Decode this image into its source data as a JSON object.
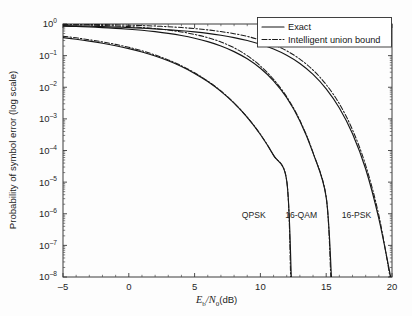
{
  "chart_data": {
    "type": "line",
    "title": "",
    "xlabel": "E_b/N_0(dB)",
    "ylabel": "Probability of symbol error (log scale)",
    "xlim": [
      -5,
      20
    ],
    "ylim": [
      1e-08,
      1
    ],
    "yscale": "log",
    "grid": false,
    "xticks": [
      -5,
      0,
      5,
      10,
      15,
      20
    ],
    "xtick_labels": [
      "-5",
      "0",
      "5",
      "10",
      "15",
      "20"
    ],
    "yticks": [
      1,
      0.1,
      0.01,
      0.001,
      0.0001,
      1e-05,
      1e-06,
      1e-07,
      1e-08
    ],
    "ytick_labels": [
      "10^0",
      "10^-1",
      "10^-2",
      "10^-3",
      "10^-4",
      "10^-5",
      "10^-6",
      "10^-7",
      "10^-8"
    ],
    "ytick_mantissa": [
      "10",
      "10",
      "10",
      "10",
      "10",
      "10",
      "10",
      "10",
      "10"
    ],
    "ytick_exponent": [
      "0",
      "-1",
      "-2",
      "-3",
      "-4",
      "-5",
      "-6",
      "-7",
      "-8"
    ],
    "legend_position": "upper right",
    "legend_entries": [
      {
        "label": "Exact",
        "style": "solid"
      },
      {
        "label": "Intelligent union bound",
        "style": "dashdot"
      }
    ],
    "annotations": [
      {
        "text": "QPSK",
        "x": 9.5,
        "y_decade": -6.15
      },
      {
        "text": "16-QAM",
        "x": 13.1,
        "y_decade": -6.15
      },
      {
        "text": "16-PSK",
        "x": 17.3,
        "y_decade": -6.15
      }
    ],
    "series": [
      {
        "name": "QPSK",
        "style": "solid",
        "variant": "Exact",
        "x": [
          -5,
          -4,
          -3,
          -2,
          -1,
          0,
          1,
          2,
          3,
          4,
          5,
          6,
          7,
          8,
          9,
          10,
          11,
          12,
          12.35
        ],
        "y": [
          0.372,
          0.33,
          0.288,
          0.246,
          0.205,
          0.166,
          0.13,
          0.097,
          0.0684,
          0.0451,
          0.0274,
          0.0151,
          0.00739,
          0.00313,
          0.00111,
          0.00032,
          7e-05,
          1.1e-05,
          1e-08
        ]
      },
      {
        "name": "QPSK",
        "style": "dashdot",
        "variant": "Intelligent union bound",
        "x": [
          -5,
          -4,
          -3,
          -2,
          -1,
          0,
          1,
          2,
          3,
          4,
          5,
          6,
          7,
          8,
          9,
          10,
          11,
          12,
          12.3
        ],
        "y": [
          0.41,
          0.365,
          0.318,
          0.272,
          0.227,
          0.183,
          0.142,
          0.105,
          0.0733,
          0.0478,
          0.0287,
          0.0157,
          0.00762,
          0.0032,
          0.00113,
          0.000325,
          7.1e-05,
          1.12e-05,
          1e-08
        ]
      },
      {
        "name": "16-QAM",
        "style": "solid",
        "variant": "Exact",
        "x": [
          -5,
          -4,
          -3,
          -2,
          -1,
          0,
          1,
          2,
          3,
          4,
          5,
          6,
          7,
          8,
          9,
          10,
          11,
          12,
          13,
          14,
          15,
          15.4
        ],
        "y": [
          0.86,
          0.835,
          0.805,
          0.77,
          0.73,
          0.685,
          0.632,
          0.572,
          0.505,
          0.432,
          0.355,
          0.277,
          0.202,
          0.134,
          0.079,
          0.0397,
          0.0159,
          0.00465,
          0.00086,
          8.4e-05,
          3.3e-06,
          1e-08
        ]
      },
      {
        "name": "16-QAM",
        "style": "dashdot",
        "variant": "Intelligent union bound",
        "x": [
          -5,
          -4,
          -3,
          -2,
          -1,
          0,
          1,
          2,
          3,
          4,
          5,
          6,
          7,
          8,
          9,
          10,
          11,
          12,
          13,
          14,
          15,
          15.35
        ],
        "y": [
          0.96,
          0.945,
          0.925,
          0.9,
          0.868,
          0.828,
          0.778,
          0.716,
          0.644,
          0.561,
          0.468,
          0.369,
          0.27,
          0.177,
          0.1,
          0.0472,
          0.0178,
          0.005,
          0.0009,
          8.6e-05,
          3.35e-06,
          1e-08
        ]
      },
      {
        "name": "16-PSK",
        "style": "solid",
        "variant": "Exact",
        "x": [
          -5,
          -4,
          -3,
          -2,
          -1,
          0,
          1,
          2,
          3,
          4,
          5,
          6,
          7,
          8,
          9,
          10,
          11,
          12,
          13,
          14,
          15,
          16,
          17,
          18,
          19,
          19.9
        ],
        "y": [
          0.885,
          0.868,
          0.848,
          0.826,
          0.8,
          0.771,
          0.738,
          0.701,
          0.66,
          0.613,
          0.561,
          0.504,
          0.44,
          0.372,
          0.3,
          0.229,
          0.162,
          0.103,
          0.0566,
          0.0256,
          0.00893,
          0.00222,
          0.00034,
          2.6e-05,
          7e-07,
          1e-08
        ]
      },
      {
        "name": "16-PSK",
        "style": "dashdot",
        "variant": "Intelligent union bound",
        "x": [
          -5,
          -4,
          -3,
          -2,
          -1,
          0,
          1,
          2,
          3,
          4,
          5,
          6,
          7,
          8,
          9,
          10,
          11,
          12,
          13,
          14,
          15,
          16,
          17,
          18,
          19,
          19.85
        ],
        "y": [
          0.99,
          0.982,
          0.972,
          0.959,
          0.942,
          0.92,
          0.893,
          0.86,
          0.82,
          0.772,
          0.716,
          0.652,
          0.578,
          0.495,
          0.405,
          0.313,
          0.223,
          0.142,
          0.0778,
          0.035,
          0.0121,
          0.003,
          0.00045,
          3.4e-05,
          9e-07,
          1e-08
        ]
      }
    ]
  },
  "figure": {
    "ylabel_text": "Probability of symbol error (log scale)",
    "xlabel_main": "E",
    "xlabel_sub1": "b",
    "xlabel_slash": "/",
    "xlabel_main2": "N",
    "xlabel_sub2": "0",
    "xlabel_unit": "(dB)"
  }
}
